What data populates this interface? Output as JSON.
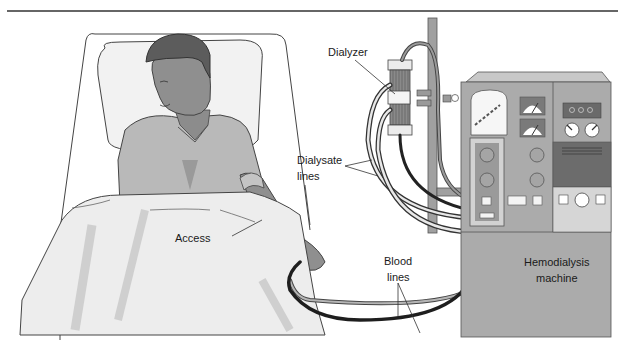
{
  "figure": {
    "labels": {
      "dialyzer": "Dialyzer",
      "dialysate_lines_1": "Dialysate",
      "dialysate_lines_2": "lines",
      "access": "Access",
      "blood_lines_1": "Blood",
      "blood_lines_2": "lines",
      "machine_1": "Hemodialysis",
      "machine_2": "machine"
    }
  },
  "colors": {
    "outline": "#333333",
    "skin": "#8c8c8c",
    "hair": "#5a5a5a",
    "gown": "#b8b8b8",
    "sheet": "#ececec",
    "machine_body": "#a8a8a8",
    "machine_dark": "#6e6e6e",
    "machine_light": "#d6d6d6",
    "tube_dark": "#2a2a2a"
  }
}
